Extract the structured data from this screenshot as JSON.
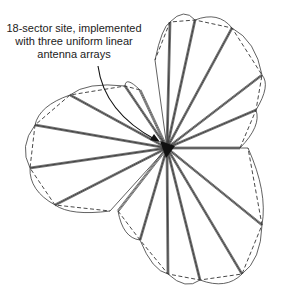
{
  "annotation": {
    "line1": "18-sector site, implemented",
    "line2": "with three uniform linear",
    "line3": "antenna arrays"
  },
  "diagram": {
    "sectors": 18,
    "arrays": 3,
    "center": [
      167,
      148
    ],
    "colors": {
      "stroke": "#3a3a3a",
      "dashed": "#333333",
      "hub": "#111111"
    }
  }
}
